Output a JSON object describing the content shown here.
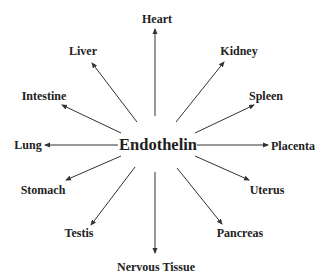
{
  "diagram": {
    "type": "radial",
    "center": {
      "label": "Endothelin",
      "x": 158,
      "y": 145
    },
    "colors": {
      "text": "#222222",
      "arrow": "#333333",
      "background": "#ffffff"
    },
    "nodes": [
      {
        "id": "heart",
        "label": "Heart",
        "x": 157,
        "y": 19,
        "from": [
          155,
          116
        ],
        "to": [
          155,
          29
        ]
      },
      {
        "id": "kidney",
        "label": "Kidney",
        "x": 239,
        "y": 51,
        "from": [
          176,
          122
        ],
        "to": [
          224,
          62
        ]
      },
      {
        "id": "spleen",
        "label": "Spleen",
        "x": 266,
        "y": 96,
        "from": [
          195,
          133
        ],
        "to": [
          254,
          105
        ]
      },
      {
        "id": "placenta",
        "label": "Placenta",
        "x": 293,
        "y": 146,
        "from": [
          197,
          145
        ],
        "to": [
          268,
          145
        ]
      },
      {
        "id": "uterus",
        "label": "Uterus",
        "x": 267,
        "y": 190,
        "from": [
          195,
          156
        ],
        "to": [
          249,
          180
        ]
      },
      {
        "id": "pancreas",
        "label": "Pancreas",
        "x": 240,
        "y": 233,
        "from": [
          177,
          168
        ],
        "to": [
          222,
          224
        ]
      },
      {
        "id": "nervous-tissue",
        "label": "Nervous Tissue",
        "x": 156,
        "y": 267,
        "from": [
          155,
          172
        ],
        "to": [
          155,
          253
        ]
      },
      {
        "id": "testis",
        "label": "Testis",
        "x": 79,
        "y": 233,
        "from": [
          135,
          167
        ],
        "to": [
          91,
          225
        ]
      },
      {
        "id": "stomach",
        "label": "Stomach",
        "x": 43,
        "y": 190,
        "from": [
          121,
          156
        ],
        "to": [
          66,
          180
        ]
      },
      {
        "id": "lung",
        "label": "Lung",
        "x": 28,
        "y": 145,
        "from": [
          118,
          145
        ],
        "to": [
          45,
          145
        ]
      },
      {
        "id": "intestine",
        "label": "Intestine",
        "x": 44,
        "y": 96,
        "from": [
          121,
          133
        ],
        "to": [
          62,
          105
        ]
      },
      {
        "id": "liver",
        "label": "Liver",
        "x": 83,
        "y": 51,
        "from": [
          137,
          122
        ],
        "to": [
          92,
          63
        ]
      }
    ]
  }
}
